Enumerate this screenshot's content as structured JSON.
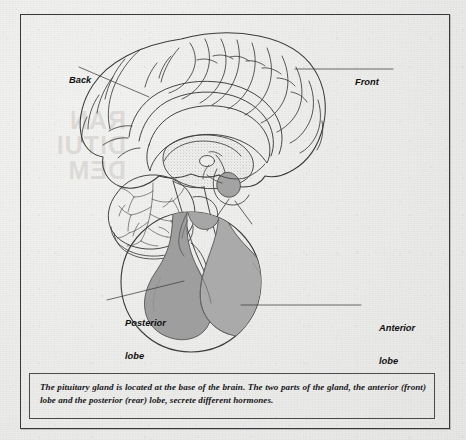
{
  "figure": {
    "caption": "The pituitary gland is located at the base of the brain. The two parts of the gland, the anterior (front) lobe and the posterior (rear) lobe, secrete different hormones.",
    "labels": {
      "back": "Back",
      "front": "Front",
      "posterior_lobe_line1": "Posterior",
      "posterior_lobe_line2": "lobe",
      "anterior_lobe_line1": "Anterior",
      "anterior_lobe_line2": "lobe"
    },
    "bleed_through_text": "RAN\nDITUI\nDEM",
    "colors": {
      "paper": "#eeeeec",
      "frame_border": "#3a3a3a",
      "caption_border": "#4a4a4a",
      "ink": "#3c3c3c",
      "gland_fill": "#a8a8a8",
      "gland_fill_dark": "#9a9a9a",
      "stipple": "#b9b9b9",
      "text": "#17171a"
    },
    "diagram": {
      "type": "anatomical-illustration",
      "views": [
        {
          "name": "midsagittal-brain-section",
          "structures": [
            "cerebral-cortex",
            "corpus-callosum",
            "thalamus",
            "cerebellum",
            "brainstem",
            "pituitary-gland"
          ]
        },
        {
          "name": "magnified-pituitary-inset",
          "shape": "circle",
          "structures": [
            "pituitary-stalk",
            "posterior-lobe",
            "anterior-lobe"
          ]
        }
      ]
    }
  }
}
